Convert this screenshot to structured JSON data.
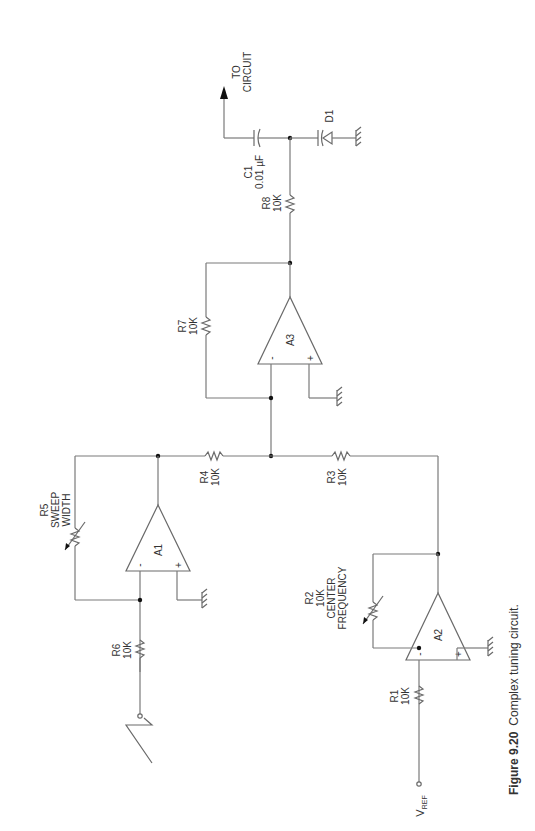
{
  "figure": {
    "number": "Figure 9.20",
    "caption": "Complex tuning circuit."
  },
  "output": {
    "line1": "TO",
    "line2": "CIRCUIT"
  },
  "components": {
    "C1": {
      "ref": "C1",
      "value": "0.01 µF"
    },
    "D1": {
      "ref": "D1"
    },
    "R8": {
      "ref": "R8",
      "value": "10K"
    },
    "R7": {
      "ref": "R7",
      "value": "10K"
    },
    "A3": {
      "ref": "A3",
      "minus": "-",
      "plus": "+"
    },
    "R4": {
      "ref": "R4",
      "value": "10K"
    },
    "R3": {
      "ref": "R3",
      "value": "10K"
    },
    "R5": {
      "ref": "R5",
      "line2": "SWEEP",
      "line3": "WIDTH"
    },
    "A1": {
      "ref": "A1",
      "minus": "-",
      "plus": "+"
    },
    "R6": {
      "ref": "R6",
      "value": "10K"
    },
    "R2": {
      "ref": "R2",
      "value": "10K",
      "line3": "CENTER",
      "line4": "FREQUENCY"
    },
    "A2": {
      "ref": "A2",
      "minus": "-",
      "plus": "+"
    },
    "R1": {
      "ref": "R1",
      "value": "10K"
    }
  },
  "vref": {
    "main": "V",
    "sub": "REF"
  }
}
